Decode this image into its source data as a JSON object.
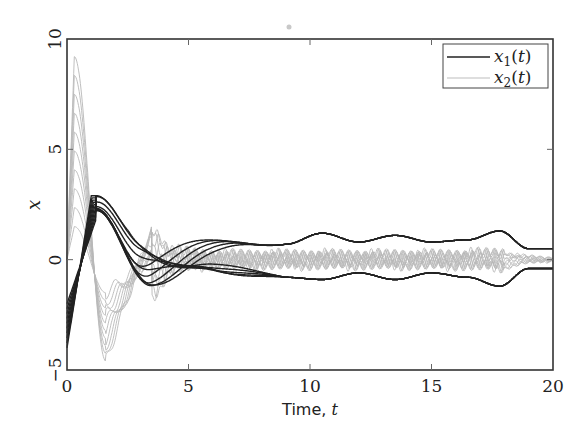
{
  "chart_data": {
    "type": "line",
    "title": "",
    "xlabel": "Time, t",
    "xlabel_text": "Time, ",
    "xlabel_var": "t",
    "ylabel": "x",
    "xlim": [
      0,
      20
    ],
    "ylim": [
      -5,
      10
    ],
    "xticks": [
      0,
      5,
      10,
      15,
      20
    ],
    "yticks": [
      -5,
      0,
      5,
      10
    ],
    "xtick_labels": [
      "0",
      "5",
      "10",
      "15",
      "20"
    ],
    "ytick_labels": [
      "−5",
      "0",
      "5",
      "10"
    ],
    "grid": false,
    "legend_position": "upper right",
    "legend": [
      {
        "label": "x1(t)",
        "var": "x",
        "sub": "1",
        "arg": "(t)",
        "color": "#222222"
      },
      {
        "label": "x2(t)",
        "var": "x",
        "sub": "2",
        "arg": "(t)",
        "color": "#b8b8b8"
      }
    ],
    "series": [
      {
        "name": "x1(t)",
        "color": "#222222",
        "description": "Family of ~10 trajectories; start between -4 and -2 at t=0, rise to peak ~3 near t=1.2, spread and damp, converging to two envelopes around +0.7 and -0.7 that oscillate gently until t=20 (ending near +0.5 and -0.4)",
        "envelope_upper": {
          "t": [
            0,
            1.2,
            3,
            6,
            9,
            10.5,
            12,
            13.5,
            15,
            16.5,
            17.8,
            19,
            20
          ],
          "x": [
            -2.0,
            2.9,
            1.0,
            1.2,
            0.7,
            1.2,
            0.8,
            1.1,
            0.8,
            0.9,
            1.3,
            0.5,
            0.5
          ]
        },
        "envelope_lower": {
          "t": [
            0,
            1.2,
            3.5,
            6,
            9,
            10.5,
            12,
            13.5,
            15,
            16.5,
            17.8,
            19,
            20
          ],
          "x": [
            -4.0,
            2.0,
            -1.8,
            -0.9,
            -0.8,
            -0.9,
            -0.6,
            -0.9,
            -0.6,
            -0.8,
            -1.2,
            -0.4,
            -0.4
          ]
        }
      },
      {
        "name": "x2(t)",
        "color": "#b8b8b8",
        "description": "Family of ~10 trajectories; start near 0, spike to peaks 2–9.2 around t=0.3, dip to about -4.6 near t=1.6, then oscillate with small jagged amplitude (~±0.5) around 0 until t=20",
        "envelope_upper": {
          "t": [
            0,
            0.3,
            1.0,
            1.6,
            3.5,
            4.5,
            6,
            10,
            15,
            18,
            19,
            20
          ],
          "x": [
            0,
            9.2,
            2.5,
            -0.5,
            2.0,
            0.6,
            0.4,
            0.4,
            0.4,
            0.5,
            0.2,
            0.1
          ]
        },
        "envelope_lower": {
          "t": [
            0,
            0.3,
            1.0,
            1.6,
            3.5,
            4.5,
            6,
            10,
            15,
            18,
            19,
            20
          ],
          "x": [
            0,
            1.5,
            -1.5,
            -4.6,
            -1.0,
            -0.4,
            -0.4,
            -0.4,
            -0.4,
            -0.6,
            -0.2,
            -0.1
          ]
        }
      }
    ]
  }
}
